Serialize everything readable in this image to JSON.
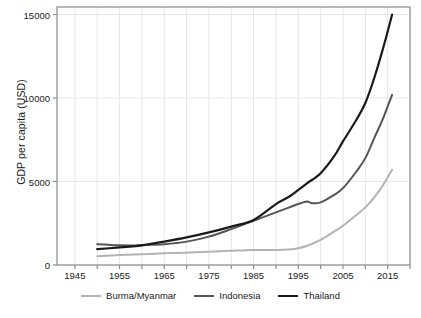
{
  "chart_data": {
    "type": "line",
    "title": "",
    "xlabel": "",
    "ylabel": "GDP per capita (USD)",
    "xlim": [
      1941,
      2020
    ],
    "ylim": [
      0,
      15450
    ],
    "grid": true,
    "legend_position": "bottom",
    "yticks": [
      0,
      5000,
      10000,
      15000
    ],
    "ytick_labels": [
      "0",
      "5000",
      "10000",
      "15000"
    ],
    "xticks": [
      1945,
      1955,
      1965,
      1975,
      1985,
      1995,
      2005,
      2015
    ],
    "xtick_labels": [
      "1945",
      "1955",
      "1965",
      "1975",
      "1985",
      "1995",
      "2005",
      "2015"
    ],
    "xminor_ticks": [
      1940,
      1950,
      1960,
      1970,
      1980,
      1990,
      2000,
      2010,
      2020
    ],
    "series": [
      {
        "name": "Burma/Myanmar",
        "color": "#b3b3b3",
        "width": 2.0,
        "x": [
          1950,
          1955,
          1960,
          1965,
          1970,
          1975,
          1980,
          1985,
          1990,
          1993,
          1995,
          1997,
          2000,
          2003,
          2005,
          2008,
          2010,
          2012,
          2014,
          2016
        ],
        "values": [
          530,
          600,
          650,
          700,
          740,
          790,
          850,
          900,
          900,
          930,
          1000,
          1150,
          1500,
          2000,
          2350,
          3000,
          3450,
          4050,
          4800,
          5700
        ]
      },
      {
        "name": "Indonesia",
        "color": "#555555",
        "width": 2.0,
        "x": [
          1950,
          1953,
          1955,
          1958,
          1960,
          1965,
          1970,
          1975,
          1980,
          1985,
          1990,
          1993,
          1995,
          1997,
          1998,
          2000,
          2003,
          2005,
          2008,
          2010,
          2012,
          2014,
          2016
        ],
        "values": [
          1250,
          1200,
          1180,
          1170,
          1200,
          1250,
          1400,
          1700,
          2150,
          2650,
          3150,
          3450,
          3650,
          3800,
          3700,
          3750,
          4200,
          4600,
          5600,
          6400,
          7600,
          8800,
          10200
        ]
      },
      {
        "name": "Thailand",
        "color": "#1a1a1a",
        "width": 2.2,
        "x": [
          1950,
          1955,
          1958,
          1960,
          1965,
          1970,
          1975,
          1980,
          1985,
          1990,
          1993,
          1995,
          1997,
          2000,
          2003,
          2005,
          2008,
          2010,
          2012,
          2014,
          2016
        ],
        "values": [
          950,
          1050,
          1120,
          1180,
          1400,
          1650,
          1950,
          2300,
          2700,
          3650,
          4100,
          4500,
          4900,
          5500,
          6500,
          7400,
          8700,
          9700,
          11200,
          13000,
          15000
        ]
      }
    ]
  },
  "axes": {
    "y_title": "GDP per capita (USD)"
  },
  "legend": {
    "items": [
      {
        "label": "Burma/Myanmar",
        "color": "#b3b3b3",
        "width": 2.0
      },
      {
        "label": "Indonesia",
        "color": "#555555",
        "width": 2.0
      },
      {
        "label": "Thailand",
        "color": "#1a1a1a",
        "width": 2.2
      }
    ]
  },
  "style": {
    "plot_border": "#8c8c8c",
    "grid_color": "#e6e6e6",
    "background": "#ffffff",
    "text_color": "#1a1a1a"
  },
  "geometry": {
    "plot_left": 57,
    "plot_right": 410,
    "plot_top": 7,
    "plot_bottom": 265
  }
}
